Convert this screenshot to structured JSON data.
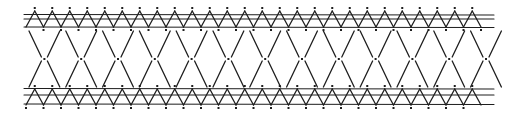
{
  "diagram": {
    "colors": {
      "ink": "#1e1e1e",
      "background": "#ffffff"
    },
    "top_band": {
      "rails_y": [
        15,
        19,
        27
      ],
      "zigzag_top": 11,
      "zigzag_bottom": 27,
      "period": 17.5
    },
    "bottom_band": {
      "rails_y": [
        89,
        95,
        104
      ],
      "zigzag_top": 89,
      "zigzag_bottom": 105,
      "period": 17.5
    },
    "lattice": {
      "y_top": 29,
      "y_mid": 59,
      "y_bottom": 89,
      "period": 36.8
    },
    "x_start": 26,
    "x_end": 492
  }
}
